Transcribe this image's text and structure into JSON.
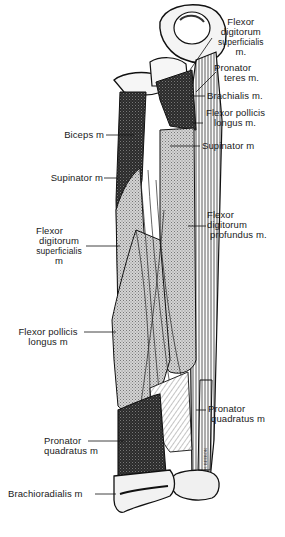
{
  "figure": {
    "colors": {
      "ink": "#111111",
      "stipple": "#bfbfbf",
      "dark": "#2a2a2a",
      "paper": "#ffffff"
    },
    "signature": "H. BEEBON"
  },
  "labels": {
    "fds_top": {
      "lines": [
        "Flexor",
        "digitorum",
        "superficialis",
        "m."
      ]
    },
    "pronator_teres": {
      "lines": [
        "Pronator",
        "teres m."
      ]
    },
    "brachialis": {
      "lines": [
        "Brachialis m."
      ]
    },
    "fpl_top": {
      "lines": [
        "Flexor pollicis",
        "longus m."
      ]
    },
    "supinator_right": {
      "lines": [
        "Supinator m"
      ]
    },
    "biceps": {
      "lines": [
        "Biceps m"
      ]
    },
    "supinator_left": {
      "lines": [
        "Supinator m"
      ]
    },
    "fds_left": {
      "lines": [
        "Flexor",
        "digitorum",
        "superficialis",
        "m"
      ]
    },
    "fdp": {
      "lines": [
        "Flexor",
        "digitorum",
        "profundus m."
      ]
    },
    "fpl_left": {
      "lines": [
        "Flexor pollicis",
        "longus m"
      ]
    },
    "pq_right": {
      "lines": [
        "Pronator",
        "quadratus m"
      ]
    },
    "pq_left": {
      "lines": [
        "Pronator",
        "quadratus m"
      ]
    },
    "brachioradialis": {
      "lines": [
        "Brachioradialis m"
      ]
    }
  }
}
